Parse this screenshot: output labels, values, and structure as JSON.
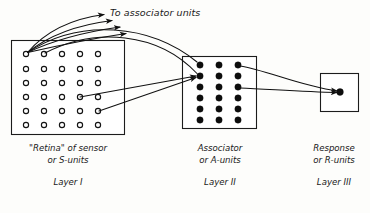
{
  "diagram": {
    "title_caption": "To associator units",
    "layers": [
      {
        "id": "layer-1",
        "line1": "\"Retina\" of sensor",
        "line2": "or S-units",
        "layer_name": "Layer I",
        "unit_type": "open-circle",
        "rows": 6,
        "cols": 5
      },
      {
        "id": "layer-2",
        "line1": "Associator",
        "line2": "or A-units",
        "layer_name": "Layer II",
        "unit_type": "filled-circle",
        "rows": 6,
        "cols": 3
      },
      {
        "id": "layer-3",
        "line1": "Response",
        "line2": "or R-units",
        "layer_name": "Layer III",
        "unit_type": "filled-circle",
        "rows": 1,
        "cols": 1
      }
    ],
    "colors": {
      "ink": "#111111",
      "paper": "#fdfdfb",
      "open_unit_fill": "#ffffff",
      "filled_unit_fill": "#0d0d0d"
    },
    "connection_counts": {
      "fan_out_from_first_s_unit": 4,
      "s_to_a_straight": 2,
      "a_to_r": 2
    }
  }
}
